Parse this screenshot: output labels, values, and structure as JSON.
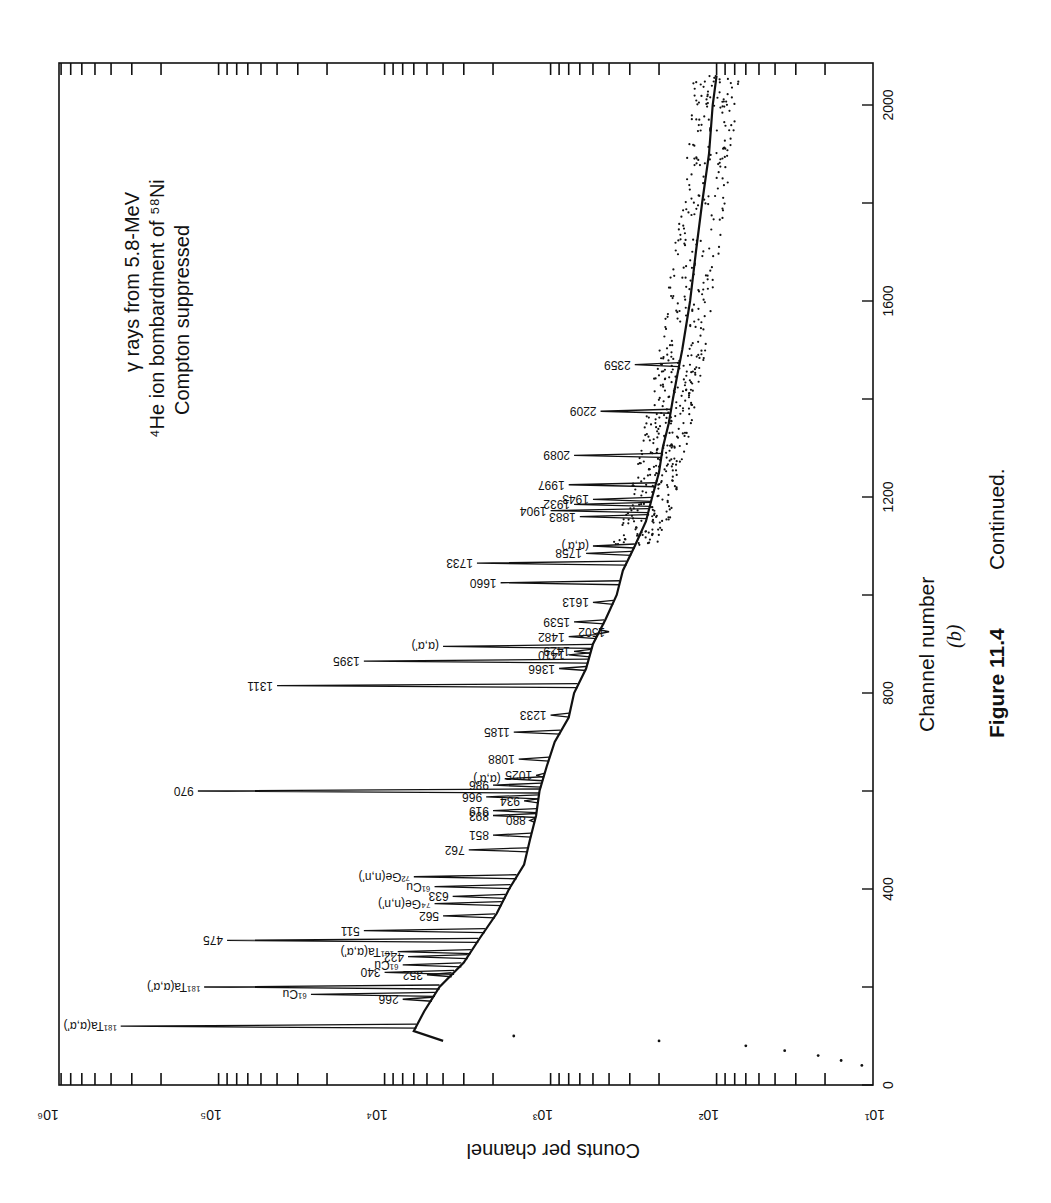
{
  "figure": {
    "caption_number": "Figure 11.4",
    "caption_text": "Continued.",
    "panel_label": "(b)",
    "annotation_lines": [
      "γ rays from 5.8-MeV",
      "⁴He ion bombardment of ⁵⁸Ni",
      "Compton suppressed"
    ]
  },
  "chart_data": {
    "type": "line",
    "orientation": "rotated 90° counter-clockwise",
    "xlabel": "Channel number",
    "ylabel": "Counts per channel",
    "xlim": [
      0,
      2180
    ],
    "ylim": [
      10,
      800000
    ],
    "yscale": "log",
    "x_ticks": [
      0,
      200,
      400,
      600,
      800,
      1000,
      1200,
      1400,
      1600,
      1800,
      2000
    ],
    "x_tick_labels": [
      "0",
      "",
      "400",
      "",
      "800",
      "",
      "1200",
      "",
      "1600",
      "",
      "2000"
    ],
    "y_ticks": [
      10,
      100,
      1000,
      10000,
      100000,
      1000000
    ],
    "y_tick_labels": [
      "10¹",
      "10²",
      "10³",
      "10⁴",
      "10⁵",
      "10⁶"
    ],
    "grid": false,
    "background": [
      {
        "x": 90,
        "y": 4000
      },
      {
        "x": 110,
        "y": 6000
      },
      {
        "x": 150,
        "y": 5200
      },
      {
        "x": 200,
        "y": 4200
      },
      {
        "x": 250,
        "y": 3000
      },
      {
        "x": 300,
        "y": 2400
      },
      {
        "x": 350,
        "y": 1900
      },
      {
        "x": 400,
        "y": 1600
      },
      {
        "x": 450,
        "y": 1300
      },
      {
        "x": 500,
        "y": 1200
      },
      {
        "x": 550,
        "y": 1100
      },
      {
        "x": 600,
        "y": 1050
      },
      {
        "x": 650,
        "y": 950
      },
      {
        "x": 700,
        "y": 850
      },
      {
        "x": 750,
        "y": 700
      },
      {
        "x": 800,
        "y": 650
      },
      {
        "x": 850,
        "y": 550
      },
      {
        "x": 900,
        "y": 500
      },
      {
        "x": 950,
        "y": 420
      },
      {
        "x": 1000,
        "y": 360
      },
      {
        "x": 1050,
        "y": 330
      },
      {
        "x": 1100,
        "y": 280
      },
      {
        "x": 1150,
        "y": 240
      },
      {
        "x": 1200,
        "y": 220
      },
      {
        "x": 1250,
        "y": 200
      },
      {
        "x": 1300,
        "y": 190
      },
      {
        "x": 1350,
        "y": 175
      },
      {
        "x": 1400,
        "y": 165
      },
      {
        "x": 1450,
        "y": 155
      },
      {
        "x": 1500,
        "y": 145
      },
      {
        "x": 1600,
        "y": 130
      },
      {
        "x": 1700,
        "y": 120
      },
      {
        "x": 1800,
        "y": 110
      },
      {
        "x": 1900,
        "y": 100
      },
      {
        "x": 2000,
        "y": 95
      },
      {
        "x": 2060,
        "y": 90
      }
    ],
    "low_channel_points": [
      {
        "x": 40,
        "y": 12
      },
      {
        "x": 50,
        "y": 16
      },
      {
        "x": 60,
        "y": 22
      },
      {
        "x": 70,
        "y": 35
      },
      {
        "x": 80,
        "y": 60
      },
      {
        "x": 90,
        "y": 200
      },
      {
        "x": 100,
        "y": 1500
      }
    ],
    "peaks": [
      {
        "label": "¹⁸¹Ta(α,α')",
        "channel": 120,
        "counts": 350000
      },
      {
        "label": "266",
        "channel": 175,
        "counts": 7000
      },
      {
        "label": "⁶¹Cu",
        "channel": 185,
        "counts": 25000
      },
      {
        "label": "¹⁸¹Ta(α,α')",
        "channel": 200,
        "counts": 110000
      },
      {
        "label": "352",
        "channel": 225,
        "counts": 5000
      },
      {
        "label": "340",
        "channel": 230,
        "counts": 9000
      },
      {
        "label": "⁶¹Cu",
        "channel": 245,
        "counts": 7000
      },
      {
        "label": "422",
        "channel": 262,
        "counts": 6500
      },
      {
        "label": "¹⁸¹Ta(α,α')",
        "channel": 272,
        "counts": 7500
      },
      {
        "label": "475",
        "channel": 295,
        "counts": 80000
      },
      {
        "label": "511",
        "channel": 315,
        "counts": 12000
      },
      {
        "label": "562",
        "channel": 345,
        "counts": 4000
      },
      {
        "label": "⁷⁴Ge(n,n')",
        "channel": 370,
        "counts": 4500
      },
      {
        "label": "633",
        "channel": 385,
        "counts": 3500
      },
      {
        "label": "⁶¹Cu",
        "channel": 405,
        "counts": 4500
      },
      {
        "label": "⁷²Ge(n,n')",
        "channel": 425,
        "counts": 6000
      },
      {
        "label": "762",
        "channel": 480,
        "counts": 2800
      },
      {
        "label": "851",
        "channel": 510,
        "counts": 2000
      },
      {
        "label": "880",
        "channel": 540,
        "counts": 1200
      },
      {
        "label": "893",
        "channel": 550,
        "counts": 2000
      },
      {
        "label": "919",
        "channel": 560,
        "counts": 2000
      },
      {
        "label": "934",
        "channel": 580,
        "counts": 1300
      },
      {
        "label": "966",
        "channel": 588,
        "counts": 2200
      },
      {
        "label": "970",
        "channel": 600,
        "counts": 120000
      },
      {
        "label": "986",
        "channel": 612,
        "counts": 2000
      },
      {
        "label": "(α,α')",
        "channel": 625,
        "counts": 1700
      },
      {
        "label": "1025",
        "channel": 632,
        "counts": 1100
      },
      {
        "label": "1088",
        "channel": 665,
        "counts": 1400
      },
      {
        "label": "1185",
        "channel": 720,
        "counts": 1500
      },
      {
        "label": "1233",
        "channel": 755,
        "counts": 900
      },
      {
        "label": "1311",
        "channel": 815,
        "counts": 40000
      },
      {
        "label": "1366",
        "channel": 850,
        "counts": 800
      },
      {
        "label": "1395",
        "channel": 865,
        "counts": 12000
      },
      {
        "label": "1410",
        "channel": 878,
        "counts": 700
      },
      {
        "label": "1429",
        "channel": 885,
        "counts": 650
      },
      {
        "label": "(α,α')",
        "channel": 895,
        "counts": 4000
      },
      {
        "label": "1482",
        "channel": 915,
        "counts": 700
      },
      {
        "label": "1502",
        "channel": 925,
        "counts": 400
      },
      {
        "label": "1539",
        "channel": 945,
        "counts": 650
      },
      {
        "label": "1613",
        "channel": 985,
        "counts": 500
      },
      {
        "label": "1660",
        "channel": 1025,
        "counts": 1800
      },
      {
        "label": "1733",
        "channel": 1065,
        "counts": 2500
      },
      {
        "label": "1758",
        "channel": 1085,
        "counts": 550
      },
      {
        "label": "(α,α')",
        "channel": 1100,
        "counts": 500
      },
      {
        "label": "1883",
        "channel": 1160,
        "counts": 600
      },
      {
        "label": "1904",
        "channel": 1172,
        "counts": 900
      },
      {
        "label": "1932",
        "channel": 1185,
        "counts": 650
      },
      {
        "label": "1943",
        "channel": 1195,
        "counts": 500
      },
      {
        "label": "1997",
        "channel": 1225,
        "counts": 700
      },
      {
        "label": "2089",
        "channel": 1285,
        "counts": 650
      },
      {
        "label": "2209",
        "channel": 1375,
        "counts": 450
      },
      {
        "label": "2359",
        "channel": 1470,
        "counts": 280
      }
    ]
  }
}
